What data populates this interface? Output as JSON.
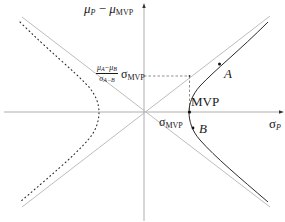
{
  "diagram": {
    "y_axis_label": {
      "main": "μ",
      "sub1": "P",
      "minus": " − ",
      "main2": "μ",
      "sub2": "MVP"
    },
    "x_axis_label": {
      "main": "σ",
      "sub": "P"
    },
    "dashed_level_label": {
      "frac_num_a": "μ",
      "frac_num_a_sub": "A",
      "frac_num_op": "−",
      "frac_num_b": "μ",
      "frac_num_b_sub": "B",
      "frac_den": "σ",
      "frac_den_sub": "A−B",
      "tail": "σ",
      "tail_sub": "MVP"
    },
    "sigma_mvp_label": {
      "main": "σ",
      "sub": "MVP"
    },
    "points": [
      {
        "id": "A",
        "label": "A",
        "x": 223,
        "y": 64
      },
      {
        "id": "MVP",
        "label": "MVP",
        "x": 189,
        "y": 112
      },
      {
        "id": "B",
        "label": "B",
        "x": 194,
        "y": 128
      }
    ],
    "elements": {
      "origin": {
        "x": 144,
        "y": 112
      },
      "frontier_solid": "right branch of hyperbola (efficient & inefficient portions)",
      "frontier_dotted": "left branch mirror (dotted)",
      "asymptotes": 2,
      "dashed_guides": "horizontal from y-axis to asymptote at σ_MVP; vertical from there down to MVP"
    },
    "colors": {
      "axis": "#9a9a9a",
      "asymptote": "#b8b8b8",
      "curve": "#2b2b2b",
      "text": "#1a1a1a",
      "dashed": "#444444"
    }
  }
}
